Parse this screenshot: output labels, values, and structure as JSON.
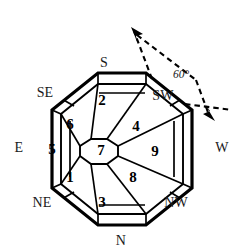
{
  "figure": {
    "background_color": "#ffffff",
    "stroke_color": "#000000",
    "fill_color": "#ffffff"
  },
  "compass": {
    "labels": [
      {
        "name": "south",
        "text": "S",
        "x": 104,
        "y": 63
      },
      {
        "name": "north",
        "text": "N",
        "x": 121,
        "y": 241
      },
      {
        "name": "east",
        "text": "E",
        "x": 19,
        "y": 148
      },
      {
        "name": "west",
        "text": "W",
        "x": 222,
        "y": 148
      },
      {
        "name": "southeast",
        "text": "SE",
        "x": 45,
        "y": 93
      },
      {
        "name": "southwest",
        "text": "SW",
        "x": 163,
        "y": 96
      },
      {
        "name": "northeast",
        "text": "NE",
        "x": 42,
        "y": 203
      },
      {
        "name": "northwest",
        "text": "NW",
        "x": 176,
        "y": 203
      }
    ]
  },
  "sectors": [
    {
      "name": "sector-2",
      "number": "2",
      "x": 102,
      "y": 100
    },
    {
      "name": "sector-6",
      "number": "6",
      "x": 70,
      "y": 124
    },
    {
      "name": "sector-4",
      "number": "4",
      "x": 136,
      "y": 126
    },
    {
      "name": "sector-5",
      "number": "5",
      "x": 52,
      "y": 149
    },
    {
      "name": "sector-7",
      "number": "7",
      "x": 101,
      "y": 150
    },
    {
      "name": "sector-9",
      "number": "9",
      "x": 155,
      "y": 151
    },
    {
      "name": "sector-1",
      "number": "1",
      "x": 70,
      "y": 177
    },
    {
      "name": "sector-8",
      "number": "8",
      "x": 133,
      "y": 177
    },
    {
      "name": "sector-3",
      "number": "3",
      "x": 102,
      "y": 202
    }
  ],
  "annotation": {
    "angle_label": "60°",
    "angle_label_x": 181,
    "angle_label_y": 75,
    "vertex": {
      "x": 152,
      "y": 79
    },
    "arrow_upper_tip": {
      "x": 133,
      "y": 30
    },
    "arrow_upper_tail": {
      "x": 141,
      "y": 19
    },
    "arrow_right_tip": {
      "x": 211,
      "y": 117
    },
    "arrow_right_tail": {
      "x": 231,
      "y": 110
    },
    "arc_start": {
      "x": 136,
      "y": 36
    },
    "arc_end": {
      "x": 207,
      "y": 113
    },
    "dash_pattern": "6,4",
    "stroke_width": 2
  },
  "geometry": {
    "outer_octagon": [
      [
        103,
        74
      ],
      [
        150,
        74
      ],
      [
        187,
        111
      ],
      [
        187,
        154
      ],
      [
        150,
        191
      ],
      [
        103,
        191
      ],
      [
        66,
        154
      ],
      [
        66,
        111
      ]
    ],
    "note": "outer octagon vertices in pixel coordinates; inner ring and sectors derived"
  }
}
